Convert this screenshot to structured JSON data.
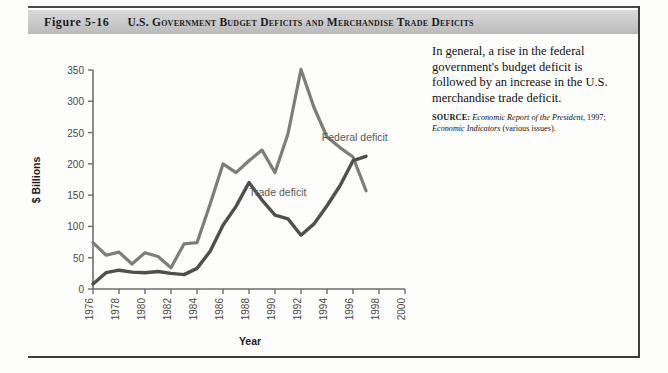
{
  "figure": {
    "number": "Figure 5-16",
    "title": "U.S. Government Budget Deficits and Merchandise Trade Deficits"
  },
  "caption": {
    "text": "In general, a rise in the federal government's budget deficit is followed by an increase in the U.S. merchandise trade deficit.",
    "source_label": "SOURCE:",
    "source_italic_1": "Economic Report of the President,",
    "source_plain_1": " 1997; ",
    "source_italic_2": "Economic Indicators",
    "source_plain_2": " (various issues)."
  },
  "colors": {
    "federal_line": "#7d7d7d",
    "trade_line": "#4f4f4f",
    "axis": "#6e6e6e",
    "banner_top": "#d9d9d9",
    "banner_bottom": "#b9b9b9",
    "rule": "#3c3c3c"
  },
  "chart_data": {
    "type": "line",
    "title": "U.S. Government Budget Deficits and Merchandise Trade Deficits",
    "xlabel": "Year",
    "ylabel": "$ Billions",
    "xlim": [
      1976,
      2000
    ],
    "ylim": [
      0,
      350
    ],
    "yticks": [
      0,
      50,
      100,
      150,
      200,
      250,
      300,
      350
    ],
    "xticks": [
      1976,
      1978,
      1980,
      1982,
      1984,
      1986,
      1988,
      1990,
      1992,
      1994,
      1996,
      1998,
      2000
    ],
    "grid": false,
    "legend_position": "inline-annotations",
    "x": [
      1976,
      1977,
      1978,
      1979,
      1980,
      1981,
      1982,
      1983,
      1984,
      1985,
      1986,
      1987,
      1988,
      1989,
      1990,
      1991,
      1992,
      1993,
      1994,
      1995,
      1996,
      1997
    ],
    "series": [
      {
        "name": "Federal deficit",
        "label": "Federal deficit",
        "color": "#7d7d7d",
        "values": [
          74,
          54,
          59,
          40,
          54,
          79,
          128,
          208,
          185,
          212,
          221,
          150,
          155,
          152,
          221,
          269,
          290,
          255,
          203,
          164,
          107,
          22
        ]
      },
      {
        "name": "Trade deficit",
        "label": "Trade deficit",
        "color": "#4f4f4f",
        "values": [
          9,
          31,
          34,
          27,
          26,
          28,
          36,
          67,
          112,
          122,
          145,
          160,
          127,
          115,
          109,
          74,
          96,
          132,
          166,
          174,
          191,
          198
        ]
      }
    ],
    "plotted_federal": [
      {
        "year": 1976,
        "value": 74
      },
      {
        "year": 1977,
        "value": 54
      },
      {
        "year": 1978,
        "value": 59
      },
      {
        "year": 1979,
        "value": 40
      },
      {
        "year": 1980,
        "value": 58
      },
      {
        "year": 1981,
        "value": 52
      },
      {
        "year": 1982,
        "value": 34
      },
      {
        "year": 1983,
        "value": 72
      },
      {
        "year": 1984,
        "value": 74
      },
      {
        "year": 1985,
        "value": 135
      },
      {
        "year": 1986,
        "value": 200
      },
      {
        "year": 1987,
        "value": 186
      },
      {
        "year": 1988,
        "value": 205
      },
      {
        "year": 1989,
        "value": 222
      },
      {
        "year": 1990,
        "value": 186
      },
      {
        "year": 1991,
        "value": 248
      },
      {
        "year": 1992,
        "value": 351
      },
      {
        "year": 1993,
        "value": 290
      },
      {
        "year": 1994,
        "value": 243
      },
      {
        "year": 1995,
        "value": 226
      },
      {
        "year": 1996,
        "value": 211
      },
      {
        "year": 1997,
        "value": 157
      }
    ],
    "plotted_trade": [
      {
        "year": 1976,
        "value": 8
      },
      {
        "year": 1977,
        "value": 26
      },
      {
        "year": 1978,
        "value": 30
      },
      {
        "year": 1979,
        "value": 27
      },
      {
        "year": 1980,
        "value": 26
      },
      {
        "year": 1981,
        "value": 28
      },
      {
        "year": 1982,
        "value": 25
      },
      {
        "year": 1983,
        "value": 23
      },
      {
        "year": 1984,
        "value": 33
      },
      {
        "year": 1985,
        "value": 60
      },
      {
        "year": 1986,
        "value": 102
      },
      {
        "year": 1987,
        "value": 132
      },
      {
        "year": 1988,
        "value": 170
      },
      {
        "year": 1989,
        "value": 142
      },
      {
        "year": 1990,
        "value": 118
      },
      {
        "year": 1991,
        "value": 112
      },
      {
        "year": 1992,
        "value": 86
      },
      {
        "year": 1993,
        "value": 104
      },
      {
        "year": 1994,
        "value": 133
      },
      {
        "year": 1995,
        "value": 165
      },
      {
        "year": 1996,
        "value": 205
      },
      {
        "year": 1997,
        "value": 212
      }
    ],
    "annotations": [
      {
        "name": "federal-deficit-label",
        "text": "Federal deficit",
        "x": 1993.6,
        "y": 236
      },
      {
        "name": "trade-deficit-label",
        "text": "Trade deficit",
        "x": 1988.0,
        "y": 148
      }
    ]
  }
}
